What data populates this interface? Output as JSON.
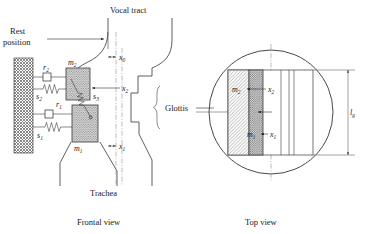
{
  "figure": {
    "labels": {
      "vocal_tract": "Vocal tract",
      "rest_position_line1": "Rest",
      "rest_position_line2": "position",
      "glottis": "Glottis",
      "trachea": "Trachea",
      "frontal_view": "Frontal view",
      "top_view": "Top view"
    },
    "symbols": {
      "x0": {
        "base": "x",
        "sub": "0"
      },
      "x1": {
        "base": "x",
        "sub": "1"
      },
      "x2": {
        "base": "x",
        "sub": "2"
      },
      "m1": {
        "base": "m",
        "sub": "1"
      },
      "m2": {
        "base": "m",
        "sub": "2"
      },
      "r1": {
        "base": "r",
        "sub": "1"
      },
      "r2": {
        "base": "r",
        "sub": "2"
      },
      "s1": {
        "base": "s",
        "sub": "1"
      },
      "s2": {
        "base": "s",
        "sub": "2"
      },
      "s3": {
        "base": "s",
        "sub": "3"
      },
      "lg": {
        "base": "l",
        "sub": "g"
      }
    },
    "frontal_view": {
      "masses": [
        "m2",
        "m1"
      ],
      "dampers": [
        "r2",
        "r1"
      ],
      "springs": [
        "s2",
        "s1"
      ],
      "coupling_spring": "s3",
      "displacements": [
        "x0",
        "x2",
        "x1"
      ]
    },
    "top_view": {
      "masses": [
        "m2",
        "m1"
      ],
      "displacements": [
        "x2",
        "x1"
      ],
      "length_label": "lg"
    },
    "colors": {
      "ink": "#1a1a1a",
      "centerline": "#8d8d8d",
      "hatch": "#6b6b6b",
      "mass_fill": "#c9c9c9",
      "wall_fill": "#bdbdbd",
      "background": "#ffffff"
    }
  }
}
